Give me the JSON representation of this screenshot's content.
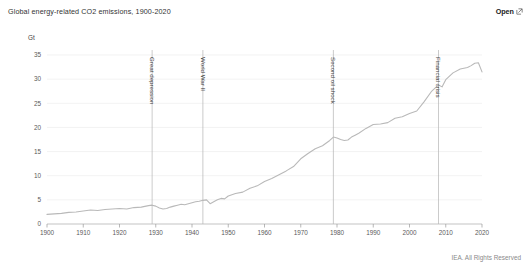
{
  "header": {
    "title": "Global energy-related CO2 emissions, 1900-2020",
    "open_label": "Open",
    "open_icon": "external-link-icon"
  },
  "footer": {
    "credit": "IEA. All Rights Reserved"
  },
  "colors": {
    "line": "#b9b9b9",
    "grid": "#ececec",
    "axis": "#aaaaaa",
    "annotation_line": "#b5b5b5",
    "text": "#5a5a5a",
    "background": "#ffffff"
  },
  "chart_data": {
    "type": "line",
    "title": "Global energy-related CO2 emissions, 1900-2020",
    "xlabel": "",
    "ylabel": "Gt",
    "unit": "Gt",
    "xlim": [
      1900,
      2020
    ],
    "ylim": [
      0,
      35
    ],
    "grid": true,
    "legend": "none",
    "yticks": [
      0,
      5,
      10,
      15,
      20,
      25,
      30,
      35
    ],
    "xticks": [
      1900,
      1910,
      1920,
      1930,
      1940,
      1950,
      1960,
      1970,
      1980,
      1990,
      2000,
      2010,
      2020
    ],
    "annotations": [
      {
        "label": "Great depression",
        "x": 1929
      },
      {
        "label": "World War II",
        "x": 1943
      },
      {
        "label": "Second oil shock",
        "x": 1979
      },
      {
        "label": "Financial crisis",
        "x": 2008
      }
    ],
    "x": [
      1900,
      1902,
      1904,
      1906,
      1908,
      1910,
      1912,
      1914,
      1916,
      1918,
      1920,
      1922,
      1924,
      1926,
      1928,
      1929,
      1930,
      1931,
      1932,
      1933,
      1934,
      1935,
      1936,
      1937,
      1938,
      1939,
      1940,
      1941,
      1942,
      1943,
      1944,
      1945,
      1946,
      1947,
      1948,
      1949,
      1950,
      1952,
      1954,
      1956,
      1958,
      1960,
      1962,
      1964,
      1966,
      1968,
      1970,
      1972,
      1974,
      1976,
      1978,
      1979,
      1980,
      1981,
      1982,
      1983,
      1984,
      1985,
      1986,
      1988,
      1990,
      1992,
      1994,
      1996,
      1998,
      2000,
      2002,
      2004,
      2006,
      2008,
      2009,
      2010,
      2012,
      2014,
      2016,
      2017,
      2018,
      2019,
      2020
    ],
    "values": [
      2.0,
      2.1,
      2.2,
      2.4,
      2.5,
      2.7,
      2.9,
      2.8,
      3.0,
      3.1,
      3.2,
      3.1,
      3.4,
      3.5,
      3.8,
      3.9,
      3.7,
      3.3,
      3.1,
      3.2,
      3.5,
      3.7,
      3.9,
      4.1,
      4.0,
      4.2,
      4.4,
      4.6,
      4.7,
      4.9,
      5.0,
      4.2,
      4.6,
      5.0,
      5.3,
      5.2,
      5.8,
      6.3,
      6.6,
      7.4,
      7.9,
      8.8,
      9.4,
      10.2,
      11.0,
      11.9,
      13.5,
      14.6,
      15.6,
      16.2,
      17.3,
      18.0,
      17.8,
      17.5,
      17.3,
      17.4,
      18.0,
      18.4,
      18.8,
      19.8,
      20.6,
      20.7,
      21.0,
      21.9,
      22.2,
      22.9,
      23.4,
      25.3,
      27.4,
      28.8,
      28.4,
      29.9,
      31.3,
      32.1,
      32.4,
      32.8,
      33.3,
      33.4,
      31.5
    ]
  }
}
